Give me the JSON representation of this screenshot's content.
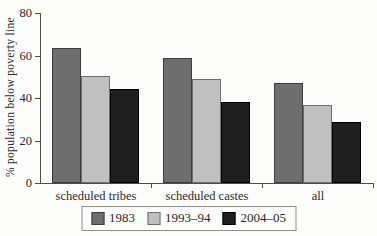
{
  "figure": {
    "background": "#fcfcfa",
    "axis_color": "#4d4d4d"
  },
  "chart_data": {
    "type": "bar",
    "title": "",
    "xlabel": "",
    "ylabel": "% population below poverty line",
    "ylim": [
      0,
      80
    ],
    "yticks": [
      0,
      20,
      40,
      60,
      80
    ],
    "grid": false,
    "legend_position": "bottom",
    "categories": [
      "scheduled tribes",
      "scheduled castes",
      "all"
    ],
    "series": [
      {
        "name": "1983",
        "color": "#6e6e6e",
        "border": "#3e3e3e",
        "values": [
          63.5,
          59,
          47
        ]
      },
      {
        "name": "1993–94",
        "color": "#c0c0c0",
        "border": "#6f6f6f",
        "values": [
          50.5,
          49,
          36.5
        ]
      },
      {
        "name": "2004–05",
        "color": "#1f1f1f",
        "border": "#000000",
        "values": [
          44,
          38,
          28.5
        ]
      }
    ]
  }
}
